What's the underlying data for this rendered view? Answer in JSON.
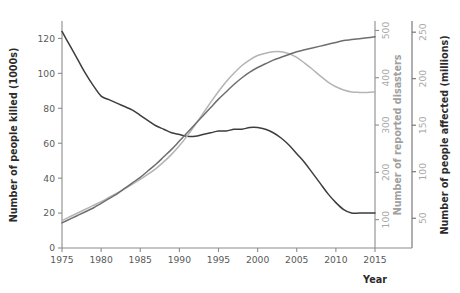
{
  "chart_data": {
    "type": "line",
    "title": "",
    "xlabel": "Year",
    "grid": false,
    "legend": "none",
    "x": [
      1975,
      1976,
      1977,
      1978,
      1979,
      1980,
      1981,
      1982,
      1983,
      1984,
      1985,
      1986,
      1987,
      1988,
      1989,
      1990,
      1991,
      1992,
      1993,
      1994,
      1995,
      1996,
      1997,
      1998,
      1999,
      2000,
      2001,
      2002,
      2003,
      2004,
      2005,
      2006,
      2007,
      2008,
      2009,
      2010,
      2011,
      2012,
      2013,
      2014,
      2015
    ],
    "xlim": [
      1975,
      2015
    ],
    "xticks": [
      1975,
      1980,
      1985,
      1990,
      1995,
      2000,
      2005,
      2010,
      2015
    ],
    "axes": [
      {
        "id": "killed",
        "position": "left",
        "label": "Number of people killed (1000s)",
        "ticks": [
          0,
          20,
          40,
          60,
          80,
          100,
          120
        ],
        "lim": [
          0,
          130
        ],
        "color": "#3d3d3d"
      },
      {
        "id": "disasters",
        "position": "right-inner",
        "label": "Number of reported disasters",
        "ticks": [
          100,
          200,
          300,
          400,
          500
        ],
        "lim": [
          40,
          520
        ],
        "color": "#b4b4b4"
      },
      {
        "id": "affected",
        "position": "right-outer",
        "label": "Number of people affected (millions)",
        "ticks": [
          50,
          100,
          150,
          200,
          250
        ],
        "lim": [
          18,
          262
        ],
        "color": "#6e6e6e"
      }
    ],
    "series": [
      {
        "name": "Number of people killed (1000s)",
        "axis": "killed",
        "color": "#3d3d3d",
        "values": [
          124,
          116,
          108,
          100,
          93,
          87,
          85,
          83,
          81,
          79,
          76,
          73,
          70,
          68,
          66,
          65,
          64,
          64,
          65,
          66,
          67,
          67,
          68,
          68,
          69,
          69,
          68,
          66,
          63,
          59,
          54,
          49,
          43,
          37,
          31,
          26,
          22,
          20,
          20,
          20,
          20
        ]
      },
      {
        "name": "Number of reported disasters",
        "axis": "disasters",
        "color": "#b4b4b4",
        "values": [
          98,
          106,
          114,
          122,
          130,
          138,
          147,
          156,
          165,
          175,
          185,
          196,
          208,
          222,
          238,
          256,
          277,
          300,
          324,
          348,
          371,
          392,
          410,
          426,
          438,
          447,
          452,
          455,
          455,
          451,
          443,
          431,
          418,
          404,
          391,
          381,
          374,
          370,
          369,
          369,
          370
        ]
      },
      {
        "name": "Number of people affected (millions)",
        "axis": "affected",
        "color": "#6e6e6e",
        "values": [
          45,
          49,
          53,
          57,
          61,
          66,
          71,
          76,
          82,
          88,
          94,
          101,
          108,
          116,
          124,
          133,
          142,
          151,
          160,
          169,
          178,
          186,
          194,
          201,
          207,
          212,
          216,
          220,
          223,
          226,
          229,
          231,
          233,
          235,
          237,
          239,
          241,
          242,
          243,
          244,
          245
        ]
      }
    ]
  },
  "axis_titles": {
    "left": "Number of people killed (1000s)",
    "middle": "Number of reported disasters",
    "right": "Number of people affected (millions)",
    "bottom": "Year"
  },
  "ticks": {
    "x": [
      "1975",
      "1980",
      "1985",
      "1990",
      "1995",
      "2000",
      "2005",
      "2010",
      "2015"
    ],
    "left": [
      "0",
      "20",
      "40",
      "60",
      "80",
      "100",
      "120"
    ],
    "middle": [
      "100",
      "200",
      "300",
      "400",
      "500"
    ],
    "right": [
      "50",
      "100",
      "150",
      "200",
      "250"
    ]
  },
  "colors": {
    "killed_line": "#3d3d3d",
    "disasters_line": "#b4b4b4",
    "affected_line": "#6e6e6e",
    "axis": "#8c8c8c",
    "background": "#ffffff"
  }
}
